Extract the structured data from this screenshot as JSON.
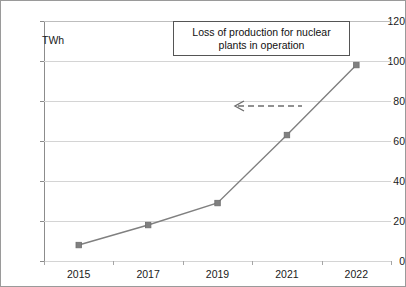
{
  "chart_data": {
    "type": "line",
    "title": "",
    "xlabel": "",
    "ylabel": "TWh",
    "categories": [
      "2015",
      "2017",
      "2019",
      "2021",
      "2022"
    ],
    "values": [
      8,
      18,
      29,
      63,
      98
    ],
    "series": [
      {
        "name": "Loss of production for nuclear plants in operation",
        "values": [
          8,
          18,
          29,
          63,
          98
        ]
      }
    ],
    "ylim": [
      0,
      120
    ],
    "y_ticks": [
      0,
      20,
      40,
      60,
      80,
      100,
      120
    ],
    "y_tick_labels": [
      "0",
      "20",
      "40",
      "60",
      "80",
      "100",
      "120"
    ],
    "grid": "horizontal",
    "legend": "none",
    "marker": "square",
    "colors": {
      "line": "#808080",
      "marker": "#808080",
      "grid": "#d4d4d4",
      "axis": "#8c8c8c",
      "text": "#1a1a1a",
      "annotation_border": "#555555"
    },
    "annotations": [
      {
        "name": "callout-box",
        "text": "Loss of production for nuclear plants in operation",
        "text_line_1": "Loss of production for nuclear",
        "text_line_2": "plants in operation"
      },
      {
        "name": "leader-arrow",
        "style": "dashed-arrow-left",
        "points_to_value": 78
      }
    ]
  },
  "axis": {
    "unit_label": "TWh"
  },
  "annotation": {
    "line1": "Loss of production for nuclear",
    "line2": "plants in operation"
  }
}
